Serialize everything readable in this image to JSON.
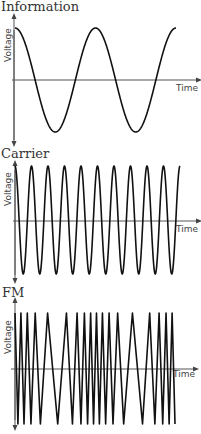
{
  "panels": [
    {
      "id": "information",
      "title": "Information",
      "ylabel": "Voltage",
      "xlabel": "Time",
      "waveform": "sine",
      "cycles": 2.0,
      "start_phase": "peak"
    },
    {
      "id": "carrier",
      "title": "Carrier",
      "ylabel": "Voltage",
      "xlabel": "Time",
      "waveform": "sine",
      "cycles": 10,
      "start_phase": "peak"
    },
    {
      "id": "fm",
      "title": "FM",
      "ylabel": "Voltage",
      "xlabel": "Time",
      "waveform": "frequency-modulated triangle"
    }
  ],
  "colors": {
    "wave": "#111111",
    "axis": "#555555",
    "text": "#333333",
    "background": "#ffffff"
  },
  "chart_data": [
    {
      "type": "line",
      "title": "Information",
      "xlabel": "Time",
      "ylabel": "Voltage",
      "description": "Low-frequency sine wave, ~2 cycles, starting at peak",
      "x": [
        0,
        0.25,
        0.5,
        0.75,
        1.0,
        1.25,
        1.5,
        1.75,
        2.0
      ],
      "values": [
        1,
        0,
        -1,
        0,
        1,
        0,
        -1,
        0,
        1
      ],
      "grid": false
    },
    {
      "type": "line",
      "title": "Carrier",
      "xlabel": "Time",
      "ylabel": "Voltage",
      "description": "High-frequency sine wave, ~10 cycles, constant amplitude",
      "cycles": 10,
      "grid": false
    },
    {
      "type": "line",
      "title": "FM",
      "xlabel": "Time",
      "ylabel": "Voltage",
      "description": "Carrier with frequency modulated by information signal: dense where information is high, sparse where low",
      "grid": false
    }
  ]
}
